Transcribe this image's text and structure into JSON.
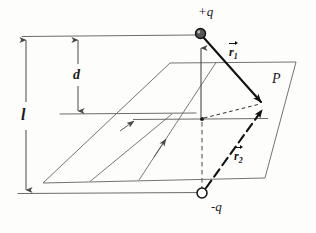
{
  "figure": {
    "kind": "physics-diagram",
    "stroke_color": "#4a4a4a",
    "bold_stroke_color": "#111111",
    "background": "#fdfdfc"
  },
  "labels": {
    "charge_positive": "+q",
    "charge_negative": "-q",
    "point": "P",
    "dim_d": "d",
    "dim_l": "l",
    "vector_r1_body": "r",
    "vector_r1_sub": "1",
    "vector_r2_body": "r",
    "vector_r2_sub": "2"
  },
  "geometry": {
    "plane_corners": [
      [
        170,
        63
      ],
      [
        296,
        62
      ],
      [
        265,
        178
      ],
      [
        43,
        183
      ]
    ],
    "charge_positive_point": [
      200,
      33
    ],
    "charge_negative_point": [
      202,
      193
    ],
    "origin_point": [
      202,
      119
    ],
    "point_p": [
      263,
      104
    ],
    "dim_l_top": [
      26,
      38
    ],
    "dim_l_bottom": [
      26,
      192
    ],
    "dim_d_top": [
      78,
      38
    ],
    "dim_d_bottom": [
      78,
      113
    ]
  }
}
